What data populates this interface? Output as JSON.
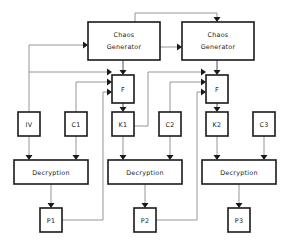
{
  "diagram": {
    "colors": {
      "box_stroke": "#1a1a1a",
      "box_fill": "#ffffff",
      "wire": "#8a8a8a",
      "wire_dark": "#3a3a3a",
      "arrow": "#1a1a1a",
      "background": "#ffffff",
      "text": "#1a1a1a"
    },
    "nodes": [
      {
        "id": "chaos1",
        "label": "Chaos Generator",
        "line1": "Chaos",
        "line2": "Generator",
        "x": 88,
        "y": 22,
        "w": 72,
        "h": 38
      },
      {
        "id": "chaos2",
        "label": "Chaos Generator",
        "line1": "Chaos",
        "line2": "Generator",
        "x": 182,
        "y": 22,
        "w": 72,
        "h": 38
      },
      {
        "id": "f1",
        "label": "F",
        "x": 112,
        "y": 75,
        "w": 22,
        "h": 28
      },
      {
        "id": "f2",
        "label": "F",
        "x": 206,
        "y": 75,
        "w": 22,
        "h": 28
      },
      {
        "id": "iv",
        "label": "IV",
        "x": 18,
        "y": 112,
        "w": 22,
        "h": 24
      },
      {
        "id": "c1",
        "label": "C1",
        "x": 65,
        "y": 112,
        "w": 22,
        "h": 24
      },
      {
        "id": "k1",
        "label": "K1",
        "x": 112,
        "y": 112,
        "w": 22,
        "h": 24
      },
      {
        "id": "c2",
        "label": "C2",
        "x": 159,
        "y": 112,
        "w": 22,
        "h": 24
      },
      {
        "id": "k2",
        "label": "K2",
        "x": 206,
        "y": 112,
        "w": 22,
        "h": 24
      },
      {
        "id": "c3",
        "label": "C3",
        "x": 253,
        "y": 112,
        "w": 22,
        "h": 24
      },
      {
        "id": "decrypt1",
        "label": "Decryption",
        "x": 14,
        "y": 160,
        "w": 74,
        "h": 24
      },
      {
        "id": "decrypt2",
        "label": "Decryption",
        "x": 108,
        "y": 160,
        "w": 74,
        "h": 24
      },
      {
        "id": "decrypt3",
        "label": "Decryption",
        "x": 202,
        "y": 160,
        "w": 74,
        "h": 24
      },
      {
        "id": "p1",
        "label": "P1",
        "x": 40,
        "y": 208,
        "w": 22,
        "h": 24
      },
      {
        "id": "p2",
        "label": "P2",
        "x": 134,
        "y": 208,
        "w": 22,
        "h": 24
      },
      {
        "id": "p3",
        "label": "P3",
        "x": 228,
        "y": 208,
        "w": 22,
        "h": 24
      }
    ],
    "edges": [
      {
        "id": "iv-to-chaos1",
        "from": "IV",
        "to": "Chaos Generator 1"
      },
      {
        "id": "iv-to-f1",
        "from": "IV",
        "to": "F 1 (top input)"
      },
      {
        "id": "c1-to-f1",
        "from": "C1",
        "to": "F 1 (middle input)"
      },
      {
        "id": "p1-to-f1",
        "from": "P1",
        "to": "F 1 (bottom input)"
      },
      {
        "id": "chaos1-to-f1",
        "from": "Chaos Generator 1",
        "to": "F 1 (top)"
      },
      {
        "id": "f1-to-k1",
        "from": "F 1",
        "to": "K1"
      },
      {
        "id": "k1-to-chaos2",
        "from": "K1",
        "to": "Chaos Generator 2 (top)"
      },
      {
        "id": "k1-to-chaos2-left",
        "from": "K1",
        "to": "Chaos Generator 2 (left)"
      },
      {
        "id": "k1-to-f2",
        "from": "K1",
        "to": "F 2 (top input)"
      },
      {
        "id": "c2-to-f2",
        "from": "C2",
        "to": "F 2 (middle input)"
      },
      {
        "id": "p2-to-f2",
        "from": "P2",
        "to": "F 2 (bottom input)"
      },
      {
        "id": "chaos2-to-f2",
        "from": "Chaos Generator 2",
        "to": "F 2 (top)"
      },
      {
        "id": "f2-to-k2",
        "from": "F 2",
        "to": "K2"
      },
      {
        "id": "iv-to-decrypt1",
        "from": "IV",
        "to": "Decryption 1"
      },
      {
        "id": "c1-to-decrypt1",
        "from": "C1",
        "to": "Decryption 1"
      },
      {
        "id": "k1-to-decrypt2",
        "from": "K1",
        "to": "Decryption 2"
      },
      {
        "id": "c2-to-decrypt2",
        "from": "C2",
        "to": "Decryption 2"
      },
      {
        "id": "k2-to-decrypt3",
        "from": "K2",
        "to": "Decryption 3"
      },
      {
        "id": "c3-to-decrypt3",
        "from": "C3",
        "to": "Decryption 3"
      },
      {
        "id": "decrypt1-to-p1",
        "from": "Decryption 1",
        "to": "P1"
      },
      {
        "id": "decrypt2-to-p2",
        "from": "Decryption 2",
        "to": "P2"
      },
      {
        "id": "decrypt3-to-p3",
        "from": "Decryption 3",
        "to": "P3"
      }
    ]
  },
  "labels": {
    "chaos1_l1": "Chaos",
    "chaos1_l2": "Generator",
    "chaos2_l1": "Chaos",
    "chaos2_l2": "Generator",
    "f1": "F",
    "f2": "F",
    "iv": "IV",
    "c1": "C1",
    "k1": "K1",
    "c2": "C2",
    "k2": "K2",
    "c3": "C3",
    "decrypt1": "Decryption",
    "decrypt2": "Decryption",
    "decrypt3": "Decryption",
    "p1": "P1",
    "p2": "P2",
    "p3": "P3"
  }
}
